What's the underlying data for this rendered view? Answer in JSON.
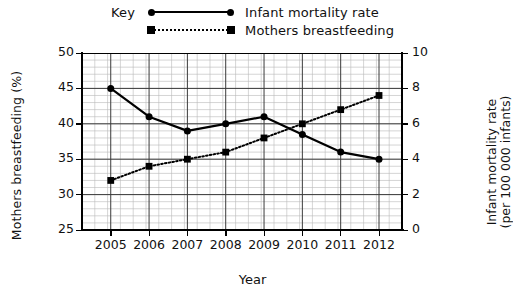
{
  "legend": {
    "key_label": "Key",
    "entries": [
      {
        "label": "Infant mortality rate",
        "style": "solid-line-circle-marker",
        "color": "#000000"
      },
      {
        "label": "Mothers breastfeeding",
        "style": "dotted-line-square-marker",
        "color": "#000000"
      }
    ]
  },
  "chart_data": {
    "type": "line",
    "title": "",
    "xlabel": "Year",
    "grid": true,
    "legend_position": "top-center",
    "categories": [
      "2005",
      "2006",
      "2007",
      "2008",
      "2009",
      "2010",
      "2011",
      "2012"
    ],
    "x": [
      2005,
      2006,
      2007,
      2008,
      2009,
      2010,
      2011,
      2012
    ],
    "axes": {
      "left": {
        "label": "Mothers breastfeeding (%)",
        "ylim": [
          25,
          50
        ],
        "ticks": [
          25,
          30,
          35,
          40,
          45,
          50
        ],
        "minor_step": 1
      },
      "right": {
        "label": "Infant mortality rate (per 100 000 infants)",
        "label_line1": "Infant mortality rate",
        "label_line2": "(per 100 000 infants)",
        "ylim": [
          0,
          10
        ],
        "ticks": [
          0,
          2,
          4,
          6,
          8,
          10
        ],
        "minor_step": 0.4
      }
    },
    "series": [
      {
        "name": "Infant mortality rate",
        "axis": "right",
        "marker": "circle",
        "line": "solid",
        "color": "#000000",
        "values": [
          8.0,
          6.4,
          5.6,
          6.0,
          6.4,
          5.4,
          4.4,
          4.0
        ],
        "values_left_scale": [
          45,
          41,
          39,
          40,
          41,
          38,
          36,
          35
        ]
      },
      {
        "name": "Mothers breastfeeding",
        "axis": "left",
        "marker": "square",
        "line": "dotted",
        "color": "#000000",
        "values": [
          32,
          34,
          35,
          36,
          38,
          40,
          42,
          44
        ]
      }
    ]
  }
}
